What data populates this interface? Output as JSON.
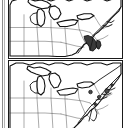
{
  "figure": {
    "kind": "two-panel-map-figure",
    "orientation": "stacked-vertical",
    "background_color": "#ffffff",
    "outline_color": "#111111",
    "border_color": "#1a1a1a",
    "gutter_color": "#8c8c8c",
    "panel_count": 2
  },
  "panels": [
    {
      "id": "top-map",
      "name": "northeastern-united-states-map-upper",
      "region": "Midwest and Northeastern United States",
      "has_frame": true,
      "highlight": {
        "name": "chesapeake-maryland-delaware-shaded-area",
        "color": "#3a3a3a",
        "label": "Maryland / Delaware / Chesapeake Bay"
      },
      "features": [
        "Great Lakes",
        "state boundaries",
        "Atlantic coastline",
        "Chesapeake Bay"
      ],
      "markers": []
    },
    {
      "id": "bottom-map",
      "name": "northeastern-united-states-map-lower",
      "region": "Midwest and Northeastern United States",
      "has_frame": true,
      "highlight": null,
      "features": [
        "Great Lakes",
        "state boundaries",
        "Atlantic coastline",
        "Chesapeake Bay"
      ],
      "markers": [
        {
          "name": "point-marker-massachusetts",
          "color": "#4a4a4a"
        },
        {
          "name": "point-marker-connecticut",
          "color": "#4a4a4a"
        },
        {
          "name": "point-marker-new-york",
          "color": "#4a4a4a"
        },
        {
          "name": "point-marker-new-jersey",
          "color": "#4a4a4a"
        },
        {
          "name": "point-marker-coastal-maine",
          "color": "#4a4a4a"
        }
      ]
    }
  ],
  "labels": {
    "top_caption": "",
    "bottom_caption": "",
    "legend": ""
  }
}
